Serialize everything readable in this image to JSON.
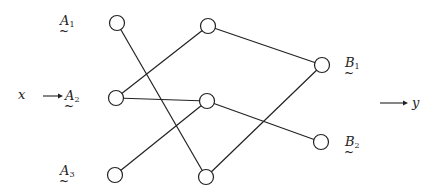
{
  "diagram": {
    "input_label": "x",
    "output_label": "y",
    "nodes": [
      {
        "id": "A1",
        "letter": "A",
        "sub": "1",
        "layer": "input"
      },
      {
        "id": "A2",
        "letter": "A",
        "sub": "2",
        "layer": "input"
      },
      {
        "id": "A3",
        "letter": "A",
        "sub": "3",
        "layer": "input"
      },
      {
        "id": "H1",
        "letter": "",
        "sub": "",
        "layer": "hidden"
      },
      {
        "id": "H2",
        "letter": "",
        "sub": "",
        "layer": "hidden"
      },
      {
        "id": "H3",
        "letter": "",
        "sub": "",
        "layer": "hidden"
      },
      {
        "id": "B1",
        "letter": "B",
        "sub": "1",
        "layer": "output"
      },
      {
        "id": "B2",
        "letter": "B",
        "sub": "2",
        "layer": "output"
      }
    ],
    "edges": [
      [
        "A1",
        "H3"
      ],
      [
        "A2",
        "H1"
      ],
      [
        "A2",
        "H2"
      ],
      [
        "A3",
        "H2"
      ],
      [
        "H1",
        "B1"
      ],
      [
        "H2",
        "B2"
      ],
      [
        "H3",
        "B1"
      ]
    ],
    "tilde": "~"
  }
}
